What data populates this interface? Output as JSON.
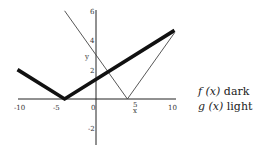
{
  "chart_data": {
    "type": "line",
    "title": "",
    "xlabel": "x",
    "ylabel": "y",
    "xlim": [
      -10,
      10
    ],
    "ylim": [
      -3,
      6
    ],
    "grid": false,
    "x_ticks": [
      -10,
      -5,
      0,
      5,
      10
    ],
    "y_ticks": [
      -2,
      2,
      4,
      6
    ],
    "series": [
      {
        "name": "f(x)",
        "style": "dark",
        "color": "#111111",
        "width": 4,
        "x": [
          -10,
          -4,
          10
        ],
        "y": [
          2,
          0,
          4.67
        ]
      },
      {
        "name": "g(x)",
        "style": "light",
        "color": "#444444",
        "width": 1,
        "x": [
          -4,
          4,
          10
        ],
        "y": [
          6,
          0,
          4.5
        ]
      }
    ],
    "legend": [
      {
        "func": "f (x)",
        "label": "dark"
      },
      {
        "func": "g (x)",
        "label": "light"
      }
    ],
    "legend_position": "right"
  },
  "axes": {
    "x_tick_labels": [
      "-10",
      "-5",
      "0",
      "5",
      "10"
    ],
    "y_tick_labels": [
      "6",
      "4",
      "2",
      "-2"
    ],
    "x_axis_label": "x",
    "y_axis_label": "y"
  }
}
